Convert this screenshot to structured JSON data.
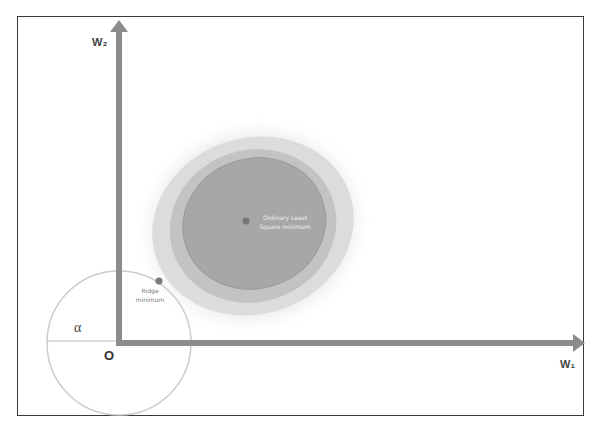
{
  "diagram": {
    "axes": {
      "x_label": "W₁",
      "y_label": "W₂",
      "origin_label": "O",
      "axis_color": "#8c8c8c"
    },
    "constraint_circle": {
      "radius_label": "α",
      "stroke_color": "#c8c8c8"
    },
    "points": {
      "ols": {
        "label_line1": "Ordinary Least",
        "label_line2": "Square minimum",
        "color": "#777777"
      },
      "ridge": {
        "label_line1": "Ridge",
        "label_line2": "minimum",
        "color": "#7a7a7a"
      }
    },
    "contour_colors": [
      "#f2f2f2",
      "#dddddd",
      "#c4c4c4",
      "#a9a9a9",
      "#9c9c9c"
    ]
  }
}
